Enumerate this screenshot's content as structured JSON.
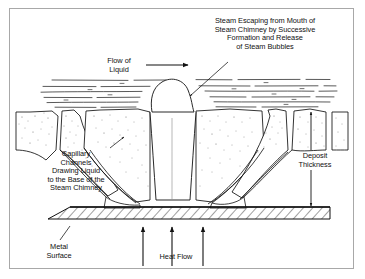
{
  "figure": {
    "background_color": "#ffffff",
    "border_color": "#a8a8a8",
    "line_color": "#111111",
    "stipple_color": "#6b6b6b"
  },
  "annotations": {
    "steam_escaping": "Steam Escaping from Mouth of\nSteam Chimney by Successive\nFormation and Release\nof Steam Bubbles",
    "flow_of_liquid": "Flow of\nLiquid",
    "capillary_channels": "Capillary\nChannels\nDrawing Liquid\nto the Base of the\nSteam Chimney",
    "deposit_thickness": "Deposit\nThickness",
    "metal_surface": "Metal\nSurface",
    "heat_flow": "Heat Flow"
  },
  "elements": {
    "liquid_flow_lines": "broken horizontal streamlines",
    "steam_bubble": "bubble at chimney mouth",
    "steam_chimney": "vertical central channel",
    "deposit_columns": "stippled porous deposit",
    "capillary_channels_count": 4,
    "metal_surface_hatching": "diagonal hatch band",
    "heat_flow_arrows": 3,
    "dimension_arrows": "double-headed vertical"
  }
}
